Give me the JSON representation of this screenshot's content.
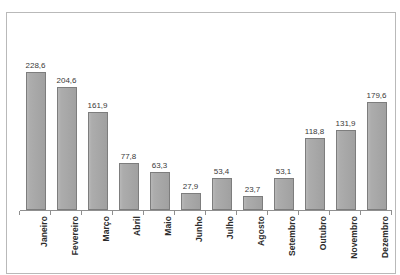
{
  "page": {
    "cropped_top_text": "",
    "background_color": "#ffffff"
  },
  "frame": {
    "border_color": "#b9b9b9"
  },
  "chart_data": {
    "type": "bar",
    "title": "",
    "subtitle": "",
    "xlabel": "",
    "ylabel": "",
    "categories": [
      "Janeiro",
      "Fevereiro",
      "Março",
      "Abril",
      "Maio",
      "Junho",
      "Julho",
      "Agosto",
      "Setembro",
      "Outubro",
      "Novembro",
      "Dezembro"
    ],
    "values": [
      228.6,
      204.6,
      161.9,
      77.8,
      63.3,
      27.9,
      53.4,
      23.7,
      53.1,
      118.8,
      131.9,
      179.6
    ],
    "value_labels": [
      "228,6",
      "204,6",
      "161,9",
      "77,8",
      "63,3",
      "27,9",
      "53,4",
      "23,7",
      "53,1",
      "118,8",
      "131,9",
      "179,6"
    ],
    "ylim": [
      0,
      228.6
    ],
    "grid": false,
    "legend": null,
    "y_axis_visible": false,
    "x_axis_visible": true,
    "bar_fill_color": "#a3a3a3",
    "bar_border_color": "#7d7d7d",
    "axis_color": "#8f8f8f",
    "label_color": "#3a3a3a",
    "category_label_rotation": -90,
    "decimal_separator": ","
  }
}
